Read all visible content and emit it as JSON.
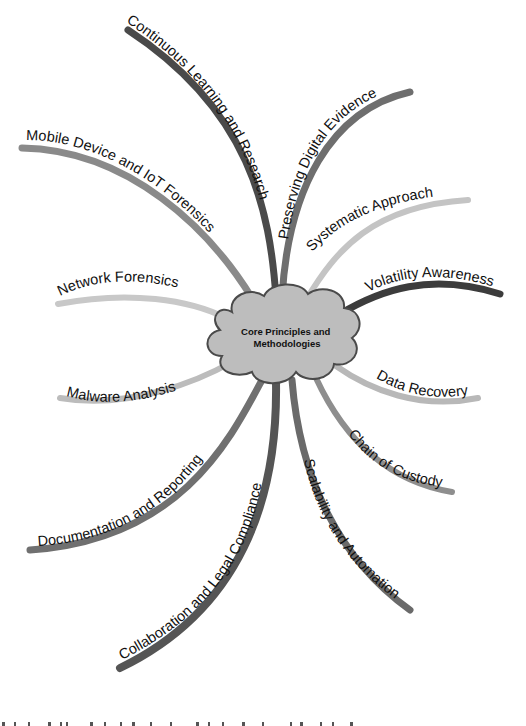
{
  "diagram": {
    "type": "mind-map",
    "center": {
      "lines": [
        "Core Principles and",
        "Methodologies"
      ],
      "fill": "#bdbdbd",
      "stroke": "#4a4a4a"
    },
    "branches": [
      {
        "id": "continuous-learning",
        "label": "Continuous Learning and Research",
        "color": "#4a4a4a"
      },
      {
        "id": "preserving-evidence",
        "label": "Preserving Digital Evidence",
        "color": "#6e6e6e"
      },
      {
        "id": "systematic-approach",
        "label": "Systematic Approach",
        "color": "#c4c4c4"
      },
      {
        "id": "volatility-awareness",
        "label": "Volatility Awareness",
        "color": "#3c3c3c"
      },
      {
        "id": "data-recovery",
        "label": "Data Recovery",
        "color": "#b8b8b8"
      },
      {
        "id": "chain-of-custody",
        "label": "Chain of Custody",
        "color": "#8e8e8e"
      },
      {
        "id": "scalability-automation",
        "label": "Scalability and Automation",
        "color": "#6a6a6a"
      },
      {
        "id": "collaboration-legal",
        "label": "Collaboration and Legal Compliance",
        "color": "#555555"
      },
      {
        "id": "documentation-reporting",
        "label": "Documentation and Reporting",
        "color": "#707070"
      },
      {
        "id": "malware-analysis",
        "label": "Malware Analysis",
        "color": "#bcbcbc"
      },
      {
        "id": "network-forensics",
        "label": "Network Forensics",
        "color": "#c8c8c8"
      },
      {
        "id": "mobile-iot",
        "label": "Mobile Device and IoT Forensics",
        "color": "#8a8a8a"
      }
    ]
  }
}
